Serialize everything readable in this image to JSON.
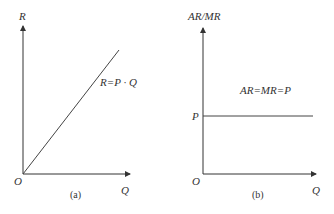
{
  "panels": [
    {
      "id": "a",
      "caption": "(a)",
      "y_axis_label": "R",
      "x_axis_label": "Q",
      "origin_label": "O",
      "curve_label": "R=P · Q",
      "curve_type": "linear-through-origin"
    },
    {
      "id": "b",
      "caption": "(b)",
      "y_axis_label": "AR/MR",
      "x_axis_label": "Q",
      "origin_label": "O",
      "price_tick_label": "P",
      "curve_label": "AR=MR=P",
      "curve_type": "horizontal-line"
    }
  ],
  "colors": {
    "axis": "#333333",
    "curve": "#444444",
    "background": "#ffffff"
  }
}
